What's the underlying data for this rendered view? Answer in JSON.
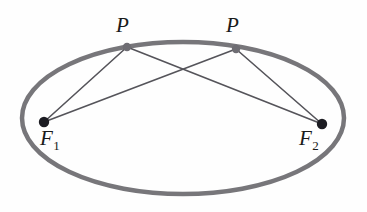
{
  "figure": {
    "name": "ellipse-foci-diagram",
    "type": "geometry-diagram",
    "background_color": "#fefefe",
    "canvas": {
      "width": 367,
      "height": 212
    }
  },
  "colors": {
    "ellipse_stroke": "#77767a",
    "focal_line": "#55545a",
    "point_dot_dark": "#1c1c22",
    "point_dot_gray": "#6e6d73",
    "label_text": "#1a1a1a"
  },
  "ellipse": {
    "center_x": 183,
    "center_y": 118,
    "radius_x": 161,
    "radius_y": 76,
    "stroke_width": 4.5
  },
  "points": [
    {
      "id": "P1",
      "label": "P",
      "x": 127,
      "y": 47,
      "dot_radius": 4.2,
      "dot_color": "#6e6d73"
    },
    {
      "id": "P2",
      "label": "P",
      "x": 236,
      "y": 49,
      "dot_radius": 4.2,
      "dot_color": "#6e6d73"
    },
    {
      "id": "F1",
      "label": "F",
      "subscript": "1",
      "x": 44,
      "y": 122,
      "dot_radius": 5.2,
      "dot_color": "#1c1c22"
    },
    {
      "id": "F2",
      "label": "F",
      "subscript": "2",
      "x": 322,
      "y": 124,
      "dot_radius": 5.2,
      "dot_color": "#1c1c22"
    }
  ],
  "segments": [
    {
      "id": "P1-F1",
      "from": "P1",
      "to": "F1",
      "x1": 127,
      "y1": 47,
      "x2": 44,
      "y2": 122,
      "stroke_width": 1.6
    },
    {
      "id": "P1-F2",
      "from": "P1",
      "to": "F2",
      "x1": 127,
      "y1": 47,
      "x2": 322,
      "y2": 124,
      "stroke_width": 1.6
    },
    {
      "id": "P2-F1",
      "from": "P2",
      "to": "F1",
      "x1": 236,
      "y1": 49,
      "x2": 44,
      "y2": 122,
      "stroke_width": 1.6
    },
    {
      "id": "P2-F2",
      "from": "P2",
      "to": "F2",
      "x1": 236,
      "y1": 49,
      "x2": 322,
      "y2": 124,
      "stroke_width": 1.6
    }
  ],
  "labels": {
    "p1": "P",
    "p2": "P",
    "f1_base": "F",
    "f1_sub": "1",
    "f2_base": "F",
    "f2_sub": "2"
  }
}
